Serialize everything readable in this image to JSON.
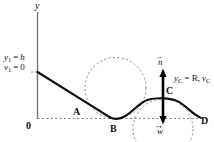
{
  "figure": {
    "kind": "physics-diagram",
    "axes": {
      "y_axis_label": "y",
      "origin_label": "0",
      "baseline_style": "dashed"
    },
    "initial_conditions": {
      "height_var": "y",
      "height_sub": "1",
      "height_eq": "=",
      "height_val": "h",
      "speed_var": "v",
      "speed_sub": "1",
      "speed_eq": "=",
      "speed_val": "0",
      "line1": "y₁ = h",
      "line2": "v₁ = 0"
    },
    "points": [
      {
        "id": "A",
        "label": "A",
        "desc": "point on incline"
      },
      {
        "id": "B",
        "label": "B",
        "desc": "bottom of valley"
      },
      {
        "id": "C",
        "label": "C",
        "desc": "top of crest"
      },
      {
        "id": "D",
        "label": "D",
        "desc": "end of track at right"
      }
    ],
    "crest_annotation": {
      "y_var": "y",
      "y_sub": "C",
      "eq1": "= R,",
      "v_var": "v",
      "v_sub": "C",
      "text": "y_C = R, v_C"
    },
    "vectors": [
      {
        "id": "n",
        "label": "n",
        "direction": "up",
        "desc": "normal force at C"
      },
      {
        "id": "w",
        "label": "w",
        "direction": "down",
        "desc": "weight at C"
      }
    ],
    "circles": [
      {
        "id": "valley-circle",
        "desc": "dashed osculating circle above valley B"
      },
      {
        "id": "crest-circle",
        "desc": "dashed osculating circle below crest C"
      }
    ],
    "colors": {
      "ink": "#111111",
      "track": "#000000",
      "dashed": "#8a8a8a",
      "axis": "#6f6f6f",
      "background": "#ffffff"
    }
  }
}
